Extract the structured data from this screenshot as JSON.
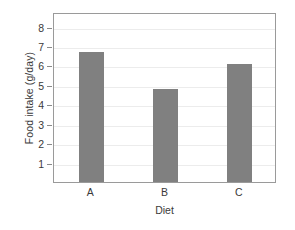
{
  "chart_data": {
    "type": "bar",
    "title": "",
    "subtitle": "",
    "categories": [
      "A",
      "B",
      "C"
    ],
    "values": [
      6.7,
      4.8,
      6.1
    ],
    "xlabel": "Diet",
    "ylabel": "Food intake (g/day)",
    "ylim": [
      0,
      8.75
    ],
    "yticks": [
      1,
      2,
      3,
      4,
      5,
      6,
      7,
      8
    ],
    "ytick_labels": [
      "1",
      "2",
      "3",
      "4",
      "5",
      "6",
      "7",
      "8"
    ],
    "grid": true,
    "grid_axis": "y",
    "legend": false,
    "legend_position": "none",
    "bar_color": "#808080",
    "frame_color": "#9a9a9a",
    "grid_color": "#ececec",
    "text_color": "#3a3a3a",
    "background": "#ffffff"
  }
}
